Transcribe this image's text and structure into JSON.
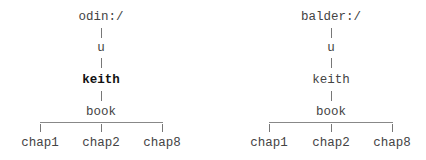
{
  "trees": [
    {
      "root": "odin:/",
      "path": [
        "u",
        "keith",
        "book"
      ],
      "highlighted": "keith",
      "children": [
        "chap1",
        "chap2",
        "chap8"
      ]
    },
    {
      "root": "balder:/",
      "path": [
        "u",
        "keith",
        "book"
      ],
      "highlighted": null,
      "children": [
        "chap1",
        "chap2",
        "chap8"
      ]
    }
  ],
  "colors": {
    "text": "#444444",
    "highlight": "#111111",
    "lines": "#777777"
  }
}
